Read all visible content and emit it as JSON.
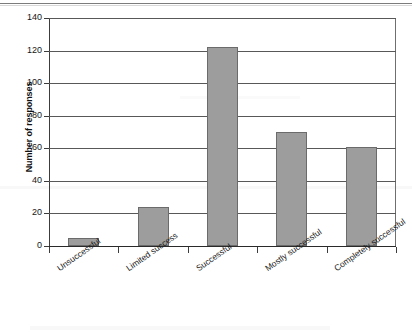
{
  "chart_data": {
    "type": "bar",
    "title": "",
    "subtitle": "",
    "xlabel": "",
    "ylabel": "Number of responses",
    "categories": [
      "Unsuccessful",
      "Limited success",
      "Successful",
      "Mostly successful",
      "Completely successful"
    ],
    "values": [
      5,
      24,
      122,
      70,
      61
    ],
    "series": [
      {
        "name": "Number of responses",
        "values": [
          5,
          24,
          122,
          70,
          61
        ]
      }
    ],
    "ylim": [
      0,
      140
    ],
    "ytick_labels": [
      "0",
      "20",
      "40",
      "60",
      "80",
      "100",
      "120",
      "140"
    ],
    "ytick_values": [
      0,
      20,
      40,
      60,
      80,
      100,
      120,
      140
    ],
    "grid": "horizontal",
    "legend": "none",
    "bar_color": "#9d9d9d",
    "bar_edge_color": "#6b6b6b",
    "gridline_color": "#585858",
    "axis_color": "#2a2a2a",
    "background_color": "#ffffff",
    "xtick_label_rotation": -35
  },
  "figure": {
    "y_axis_title": "Number of responses"
  }
}
